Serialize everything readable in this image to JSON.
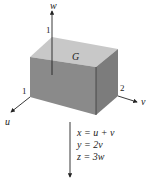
{
  "figure": {
    "region_label": "G",
    "axes": {
      "w": {
        "label": "w",
        "tick": "1"
      },
      "u": {
        "label": "u",
        "tick": "1"
      },
      "v": {
        "label": "v",
        "tick": "2"
      }
    },
    "equations": [
      "x = u + v",
      "y = 2v",
      "z = 3w"
    ],
    "colors": {
      "top_face": "#c8c8c8",
      "front_face": "#8a8a8a",
      "right_face": "#7a7a7a",
      "axis": "#222222"
    }
  }
}
